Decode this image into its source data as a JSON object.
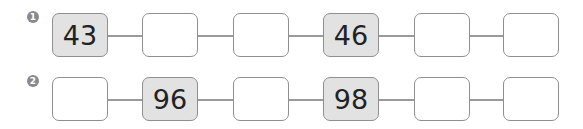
{
  "colors": {
    "given_fill": "#e2e2e2",
    "empty_fill": "#ffffff",
    "border": "#8f8f8f",
    "badge": "#8a8a8a"
  },
  "rows": [
    {
      "label": "1",
      "boxes": [
        "43",
        "",
        "",
        "46",
        "",
        ""
      ],
      "given": [
        true,
        false,
        false,
        true,
        false,
        false
      ]
    },
    {
      "label": "2",
      "boxes": [
        "",
        "96",
        "",
        "98",
        "",
        ""
      ],
      "given": [
        false,
        true,
        false,
        true,
        false,
        false
      ]
    }
  ]
}
